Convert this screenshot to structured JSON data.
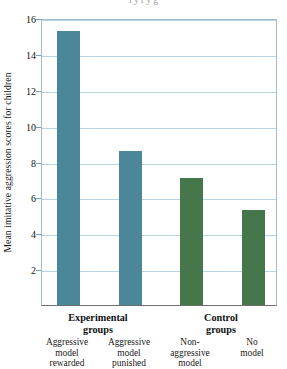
{
  "figure": {
    "clipped_header_text": "l   y        t                                                  y    g"
  },
  "chart_data": {
    "type": "bar",
    "title": "",
    "xlabel": "",
    "ylabel": "Mean imitative aggression scores for children",
    "ylim": [
      0,
      16
    ],
    "ytick_values": [
      0,
      2,
      4,
      6,
      8,
      10,
      12,
      14,
      16
    ],
    "ytick_labels": [
      "",
      "2",
      "4",
      "6",
      "8",
      "10",
      "12",
      "14",
      "16"
    ],
    "grid": true,
    "legend": "none",
    "categories": [
      "Aggressive model rewarded",
      "Aggressive model punished",
      "Non-aggressive model",
      "No model"
    ],
    "category_lines": [
      [
        "Aggressive",
        "model",
        "rewarded"
      ],
      [
        "Aggressive",
        "model",
        "punished"
      ],
      [
        "Non-",
        "aggressive",
        "model"
      ],
      [
        "No",
        "model"
      ]
    ],
    "values": [
      15.3,
      8.6,
      7.1,
      5.3
    ],
    "bar_colors": [
      "#4b8799",
      "#4b8799",
      "#45774a",
      "#45774a"
    ],
    "groups": [
      {
        "label_line1": "Experimental",
        "label_line2": "groups",
        "members": [
          0,
          1
        ]
      },
      {
        "label_line1": "Control",
        "label_line2": "groups",
        "members": [
          2,
          3
        ]
      }
    ],
    "colors": {
      "experimental_bar": "#4b8799",
      "control_bar": "#45774a",
      "gridline": "#b9d2e2",
      "axis": "#6f6f6f",
      "frame": "#9fbdd0",
      "background": "#ffffff",
      "text": "#1b1b1b"
    }
  }
}
